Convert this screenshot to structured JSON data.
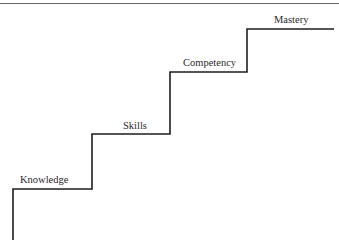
{
  "diagram": {
    "type": "staircase",
    "steps": [
      {
        "label": "Knowledge"
      },
      {
        "label": "Skills"
      },
      {
        "label": "Competency"
      },
      {
        "label": "Mastery"
      }
    ],
    "line_color": "#1e1e1e",
    "rule_color": "#6a6a6a"
  }
}
